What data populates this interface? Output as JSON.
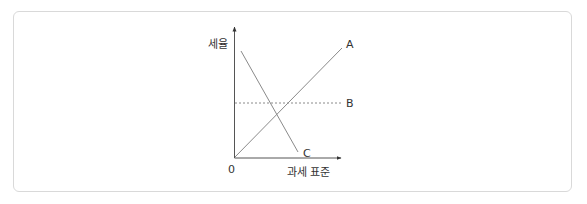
{
  "diagram": {
    "title": "",
    "axes": {
      "y_label": "세율",
      "x_label": "과세 표준",
      "origin_label": "0"
    },
    "lines": [
      {
        "id": "A",
        "label": "A",
        "style": "solid",
        "description": "rising line from origin (progressive)"
      },
      {
        "id": "B",
        "label": "B",
        "style": "dotted",
        "description": "horizontal line (proportional)"
      },
      {
        "id": "C",
        "label": "C",
        "style": "solid",
        "description": "falling line (regressive)"
      }
    ],
    "colors": {
      "line": "#8a8a8a",
      "axis": "#555555",
      "text": "#333333",
      "frame": "#d9d9d9"
    }
  }
}
